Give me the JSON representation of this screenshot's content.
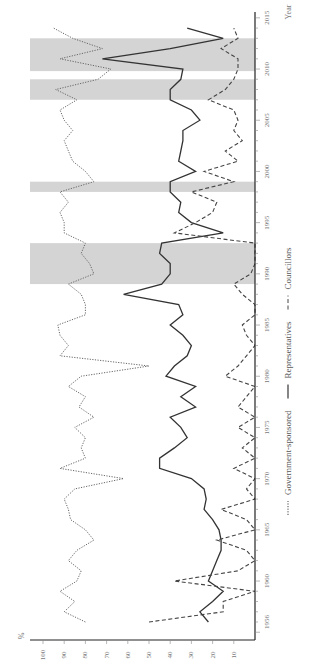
{
  "chart_data": {
    "type": "line",
    "orientation": "rotated-90-clockwise",
    "title": "",
    "xlabel": "Year",
    "ylabel": "%",
    "ylim": [
      0,
      100
    ],
    "y_ticks": [
      100,
      90,
      80,
      70,
      60,
      50,
      40,
      30,
      20,
      10
    ],
    "x_ticks": [
      1956,
      1960,
      1965,
      1970,
      1975,
      1980,
      1985,
      1990,
      1995,
      2000,
      2005,
      2010,
      2015
    ],
    "x_range": [
      1955,
      2015
    ],
    "grid": false,
    "legend_position": "bottom",
    "shaded_periods": [
      [
        1989,
        1993
      ],
      [
        1998,
        1999
      ],
      [
        2007,
        2009
      ],
      [
        2009.8,
        2013
      ]
    ],
    "series": [
      {
        "name": "Government-sponsored",
        "style": "dotted",
        "color": "#666666",
        "x": [
          1956,
          1957,
          1958,
          1959,
          1960,
          1961,
          1962,
          1963,
          1964,
          1965,
          1966,
          1967,
          1968,
          1969,
          1970,
          1971,
          1972,
          1973,
          1974,
          1975,
          1976,
          1977,
          1978,
          1979,
          1980,
          1981,
          1982,
          1983,
          1984,
          1985,
          1986,
          1987,
          1988,
          1989,
          1990,
          1991,
          1992,
          1993,
          1994,
          1995,
          1996,
          1997,
          1998,
          1999,
          2000,
          2001,
          2002,
          2003,
          2004,
          2005,
          2006,
          2007,
          2008,
          2009,
          2010,
          2011,
          2012,
          2013,
          2014
        ],
        "values": [
          80,
          90,
          85,
          92,
          84,
          82,
          88,
          84,
          76,
          80,
          87,
          88,
          90,
          85,
          62,
          92,
          80,
          82,
          80,
          85,
          76,
          83,
          80,
          88,
          82,
          50,
          92,
          88,
          92,
          93,
          80,
          80,
          82,
          88,
          76,
          78,
          82,
          80,
          90,
          90,
          92,
          88,
          92,
          76,
          80,
          86,
          88,
          90,
          86,
          90,
          92,
          84,
          94,
          74,
          68,
          92,
          72,
          86,
          95
        ],
        "last_values": [
          80,
          80
        ]
      },
      {
        "name": "Representatives",
        "style": "solid",
        "color": "#333333",
        "x": [
          1956,
          1957,
          1958,
          1959,
          1960,
          1961,
          1962,
          1963,
          1964,
          1965,
          1966,
          1967,
          1968,
          1969,
          1970,
          1971,
          1972,
          1973,
          1974,
          1975,
          1976,
          1977,
          1978,
          1979,
          1980,
          1981,
          1982,
          1983,
          1984,
          1985,
          1986,
          1987,
          1988,
          1989,
          1990,
          1991,
          1992,
          1993,
          1994,
          1995,
          1996,
          1997,
          1998,
          1999,
          2000,
          2001,
          2002,
          2003,
          2004,
          2005,
          2006,
          2007,
          2008,
          2009,
          2010,
          2011,
          2012,
          2013,
          2014
        ],
        "values": [
          22,
          26,
          20,
          15,
          22,
          20,
          18,
          16,
          16,
          17,
          20,
          24,
          23,
          24,
          30,
          45,
          45,
          38,
          32,
          35,
          40,
          28,
          35,
          28,
          42,
          38,
          32,
          30,
          34,
          40,
          34,
          36,
          62,
          44,
          40,
          40,
          45,
          44,
          15,
          30,
          36,
          35,
          40,
          40,
          28,
          36,
          35,
          34,
          34,
          26,
          30,
          40,
          40,
          35,
          34,
          72,
          40,
          15,
          32
        ],
        "last_values": [
          40,
          32
        ]
      },
      {
        "name": "Councillors",
        "style": "dashed",
        "color": "#444444",
        "x": [
          1956,
          1957,
          1958,
          1959,
          1960,
          1961,
          1962,
          1963,
          1964,
          1965,
          1966,
          1967,
          1968,
          1969,
          1970,
          1971,
          1972,
          1973,
          1974,
          1975,
          1976,
          1977,
          1978,
          1979,
          1980,
          1981,
          1982,
          1983,
          1984,
          1985,
          1986,
          1987,
          1988,
          1989,
          1990,
          1991,
          1992,
          1993,
          1994,
          1995,
          1996,
          1997,
          1998,
          1999,
          2000,
          2001,
          2002,
          2003,
          2004,
          2005,
          2006,
          2007,
          2008,
          2009,
          2010,
          2011,
          2012,
          2013,
          2014
        ],
        "values": [
          50,
          15,
          15,
          0,
          38,
          8,
          0,
          4,
          18,
          0,
          4,
          16,
          0,
          4,
          0,
          10,
          0,
          6,
          0,
          8,
          0,
          8,
          4,
          0,
          14,
          8,
          4,
          0,
          4,
          6,
          0,
          0,
          6,
          10,
          2,
          0,
          0,
          0,
          38,
          28,
          20,
          18,
          30,
          10,
          24,
          8,
          14,
          6,
          10,
          8,
          10,
          22,
          14,
          10,
          8,
          8,
          16,
          8,
          10
        ],
        "last_values": [
          10,
          10
        ]
      }
    ]
  },
  "legend": {
    "items": [
      {
        "label": "Government-sponsored",
        "style": "dotted"
      },
      {
        "label": "Representatives",
        "style": "solid"
      },
      {
        "label": "Councillors",
        "style": "dashed"
      }
    ]
  },
  "axes": {
    "y_unit_label": "%",
    "x_title": "Year"
  }
}
